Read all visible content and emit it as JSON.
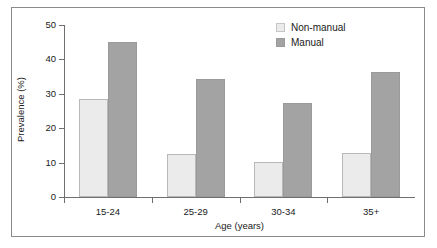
{
  "chart_data": {
    "type": "bar",
    "title": "",
    "subtitle": "",
    "xlabel": "Age (years)",
    "ylabel": "Prevalence (%)",
    "categories": [
      "15-24",
      "25-29",
      "30-34",
      "35+"
    ],
    "series": [
      {
        "name": "Non-manual",
        "color": "#ebebeb",
        "values": [
          28.4,
          12.5,
          10.3,
          12.7
        ]
      },
      {
        "name": "Manual",
        "color": "#a3a3a3",
        "values": [
          45.1,
          34.4,
          27.3,
          36.3
        ]
      }
    ],
    "ylim": [
      0,
      50
    ],
    "yticks": [
      0,
      10,
      20,
      30,
      40,
      50
    ],
    "ytick_labels": [
      "0",
      "10",
      "20",
      "30",
      "40",
      "50"
    ],
    "grid": false,
    "legend_position": "top-right",
    "legend_entries": [
      "Non-manual",
      "Manual"
    ],
    "annotations": []
  },
  "figure": {
    "border_color": "#8a8a8a",
    "axis_color": "#6f6f6f",
    "background": "#ffffff"
  }
}
